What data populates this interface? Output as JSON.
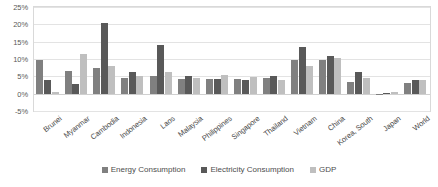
{
  "chart_data": {
    "type": "bar",
    "title": "",
    "subtitle": "",
    "xlabel": "",
    "ylabel": "",
    "ylim": [
      -5,
      25
    ],
    "yticks": [
      25,
      20,
      15,
      10,
      5,
      0,
      -5
    ],
    "ytick_labels": [
      "25%",
      "20%",
      "15%",
      "10%",
      "5%",
      "0%",
      "-5%"
    ],
    "grid": true,
    "legend_position": "bottom",
    "categories": [
      "Brunei",
      "Myanmar",
      "Cambodia",
      "Indonesia",
      "Laos",
      "Malaysia",
      "Philippines",
      "Singapore",
      "Thailand",
      "Vietnam",
      "China",
      "Korea, South",
      "Japan",
      "World"
    ],
    "series": [
      {
        "name": "Energy Consumption",
        "color": "#808080",
        "values": [
          9.6,
          6.5,
          7.5,
          4.4,
          5.0,
          4.3,
          4.3,
          4.2,
          4.5,
          9.8,
          9.8,
          3.3,
          -0.3,
          3.1
        ]
      },
      {
        "name": "Electricity Consumption",
        "color": "#595959",
        "values": [
          4.0,
          2.8,
          20.5,
          6.2,
          13.9,
          5.2,
          4.2,
          3.9,
          5.2,
          13.6,
          11.0,
          6.3,
          0.2,
          3.9
        ]
      },
      {
        "name": "GDP",
        "color": "#bfbfbf",
        "values": [
          0.6,
          11.4,
          8.1,
          5.2,
          6.3,
          4.4,
          5.3,
          4.9,
          3.9,
          7.9,
          10.4,
          4.4,
          0.4,
          4.0
        ]
      }
    ]
  },
  "legend": {
    "items": [
      {
        "label": "Energy Consumption",
        "color": "#808080"
      },
      {
        "label": "Electricity Consumption",
        "color": "#595959"
      },
      {
        "label": "GDP",
        "color": "#bfbfbf"
      }
    ]
  }
}
